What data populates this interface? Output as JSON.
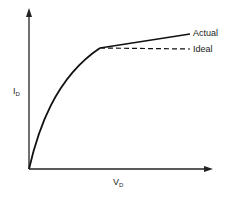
{
  "diagram": {
    "type": "line",
    "title": "",
    "xlabel": {
      "main": "V",
      "sub": "D"
    },
    "ylabel": {
      "main": "I",
      "sub": "D"
    },
    "curves": [
      {
        "name": "Actual",
        "style": "solid"
      },
      {
        "name": "Ideal",
        "style": "dashed"
      }
    ],
    "labels": {
      "actual": "Actual",
      "ideal": "Ideal"
    }
  }
}
